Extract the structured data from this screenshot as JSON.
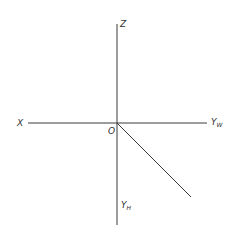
{
  "diagram": {
    "type": "three-projection-plane-axes",
    "origin": {
      "label": "O",
      "x": 117,
      "y": 123
    },
    "axes": [
      {
        "id": "z",
        "label": "Z",
        "subscript": "",
        "x1": 117,
        "y1": 24,
        "x2": 117,
        "y2": 123
      },
      {
        "id": "x",
        "label": "X",
        "subscript": "",
        "x1": 28,
        "y1": 123,
        "x2": 117,
        "y2": 123
      },
      {
        "id": "yw",
        "label": "Y",
        "subscript": "W",
        "x1": 117,
        "y1": 123,
        "x2": 207,
        "y2": 123
      },
      {
        "id": "yh",
        "label": "Y",
        "subscript": "H",
        "x1": 117,
        "y1": 123,
        "x2": 117,
        "y2": 225
      },
      {
        "id": "diag",
        "label": "",
        "subscript": "",
        "x1": 117,
        "y1": 123,
        "x2": 191,
        "y2": 197
      }
    ],
    "labels": {
      "z": "Z",
      "x": "X",
      "o": "O",
      "yw_main": "Y",
      "yw_sub": "W",
      "yh_main": "Y",
      "yh_sub": "H"
    },
    "colors": {
      "line": "#3a3a3a",
      "text": "#333333",
      "background": "#ffffff"
    }
  }
}
